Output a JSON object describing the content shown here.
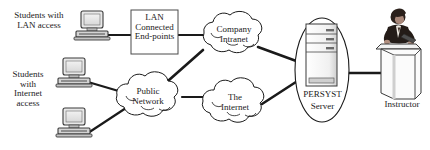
{
  "diagram": {
    "background_color": "#ffffff",
    "line_color": "#1a1a1a",
    "nodes": {
      "lan_students_label": "Students with\nLAN access",
      "internet_students_label": "Students\nwith\nInternet\naccess",
      "lan_box_label": "LAN\nConnected\nEnd-points",
      "company_intranet_label": "Company\nIntranet",
      "public_network_label": "Public\nNetwork",
      "the_internet_label": "The\nInternet",
      "persyst_server_label_line1": "PERSYST",
      "persyst_server_label_line2": "Server",
      "instructor_label": "Instructor"
    },
    "icons": {
      "computer_lan": "desktop-computer-icon",
      "computer_internet_top": "desktop-computer-icon",
      "computer_internet_bottom": "desktop-computer-icon",
      "server": "server-tower-icon",
      "instructor": "person-at-podium-icon"
    },
    "connections": [
      {
        "from": "computer_lan",
        "to": "lan_box"
      },
      {
        "from": "lan_box",
        "to": "company_intranet"
      },
      {
        "from": "computer_internet_top",
        "to": "public_network"
      },
      {
        "from": "computer_internet_bottom",
        "to": "public_network"
      },
      {
        "from": "public_network",
        "to": "company_intranet"
      },
      {
        "from": "public_network",
        "to": "the_internet"
      },
      {
        "from": "company_intranet",
        "to": "persyst_server"
      },
      {
        "from": "the_internet",
        "to": "persyst_server"
      },
      {
        "from": "persyst_server",
        "to": "instructor"
      }
    ]
  }
}
